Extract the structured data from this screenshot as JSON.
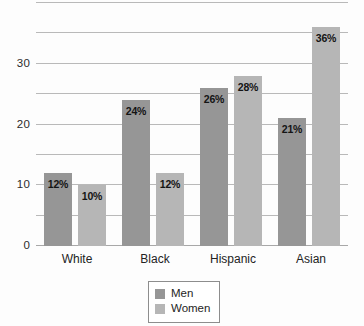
{
  "chart_data": {
    "type": "bar",
    "title": "",
    "subtitle": "",
    "xlabel": "",
    "ylabel": "",
    "categories": [
      "White",
      "Black",
      "Hispanic",
      "Asian"
    ],
    "series": [
      {
        "name": "Men",
        "color": "#969696",
        "values": [
          12,
          24,
          26,
          21
        ],
        "labels": [
          "12%",
          "24%",
          "26%",
          "21%"
        ]
      },
      {
        "name": "Women",
        "color": "#b6b6b6",
        "values": [
          10,
          12,
          28,
          36
        ],
        "labels": [
          "10%",
          "12%",
          "28%",
          "36%"
        ]
      }
    ],
    "ylim": [
      0,
      40
    ],
    "yticks": [
      0,
      5,
      10,
      15,
      20,
      25,
      30,
      35,
      40
    ],
    "ytick_labels": [
      "0",
      "",
      "10",
      "",
      "20",
      "",
      "30",
      "",
      ""
    ],
    "grid": true,
    "legend_position": "bottom-center",
    "legend_entries": [
      "Men",
      "Women"
    ]
  },
  "axis": {
    "y_labels": [
      {
        "value": 0,
        "text": "0"
      },
      {
        "value": 10,
        "text": "10"
      },
      {
        "value": 20,
        "text": "20"
      },
      {
        "value": 30,
        "text": "30"
      }
    ]
  },
  "legend": {
    "items": [
      {
        "label": "Men",
        "color": "#969696"
      },
      {
        "label": "Women",
        "color": "#b6b6b6"
      }
    ]
  },
  "colors": {
    "men": "#969696",
    "women": "#b6b6b6",
    "gridline": "#b9b9b9",
    "text": "#232323",
    "background": "#fdfdfd"
  }
}
